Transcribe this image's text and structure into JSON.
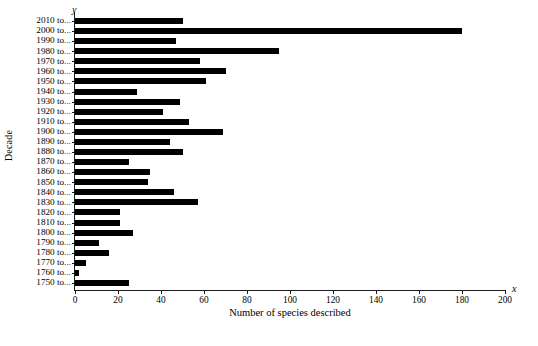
{
  "chart_data": {
    "type": "bar",
    "orientation": "horizontal",
    "title": "",
    "xlabel": "Number of species described",
    "ylabel": "Decade",
    "xlim": [
      0,
      200
    ],
    "xticks": [
      0,
      20,
      40,
      60,
      80,
      100,
      120,
      140,
      160,
      180,
      200
    ],
    "grid": false,
    "legend": false,
    "axis_letters": {
      "x": "x",
      "y": "y"
    },
    "categories": [
      "2010 to...",
      "2000 to...",
      "1990 to...",
      "1980 to...",
      "1970 to...",
      "1960 to...",
      "1950 to...",
      "1940 to...",
      "1930 to...",
      "1920 to...",
      "1910 to...",
      "1900 to...",
      "1890 to...",
      "1880 to...",
      "1870 to...",
      "1860 to...",
      "1850 to...",
      "1840 to...",
      "1830 to...",
      "1820 to...",
      "1810 to...",
      "1800 to...",
      "1790 to...",
      "1780 to...",
      "1770 to...",
      "1760 to...",
      "1750 to..."
    ],
    "values": [
      50,
      180,
      47,
      95,
      58,
      70,
      61,
      29,
      49,
      41,
      53,
      69,
      44,
      50,
      25,
      35,
      34,
      46,
      57,
      21,
      21,
      27,
      11,
      16,
      5,
      2,
      25
    ],
    "bar_color": "#000000"
  }
}
